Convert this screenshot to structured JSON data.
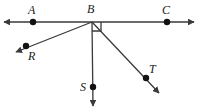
{
  "figure": {
    "stroke_color": "#3a3a3a",
    "label_color": "#1a1a1a",
    "background_color": "#ffffff",
    "width": 198,
    "height": 109,
    "line_width": 1.3,
    "dot_radius": 3.2
  },
  "points": [
    {
      "id": "A",
      "label": "A",
      "x": 33,
      "y": 22,
      "label_x": 28,
      "label_y": 4,
      "has_dot": true
    },
    {
      "id": "B",
      "label": "B",
      "x": 92,
      "y": 22,
      "label_x": 87,
      "label_y": 3,
      "has_dot": false
    },
    {
      "id": "C",
      "label": "C",
      "x": 167,
      "y": 22,
      "label_x": 162,
      "label_y": 4,
      "has_dot": true
    },
    {
      "id": "R",
      "label": "R",
      "x": 26,
      "y": 46,
      "label_x": 28,
      "label_y": 50,
      "has_dot": true
    },
    {
      "id": "S",
      "label": "S",
      "x": 93,
      "y": 87,
      "label_x": 80,
      "label_y": 81,
      "has_dot": true
    },
    {
      "id": "T",
      "label": "T",
      "x": 146,
      "y": 78,
      "label_x": 149,
      "label_y": 63,
      "has_dot": true
    }
  ],
  "line": {
    "name": "line-AC",
    "from_x": 4,
    "from_y": 22,
    "to_x": 194,
    "to_y": 22,
    "double_arrow": true
  },
  "rays": [
    {
      "name": "ray-BR",
      "from_x": 92,
      "from_y": 22,
      "to_x": 16,
      "to_y": 52
    },
    {
      "name": "ray-BS",
      "from_x": 92,
      "from_y": 22,
      "to_x": 93,
      "to_y": 106
    },
    {
      "name": "ray-BT",
      "from_x": 92,
      "from_y": 22,
      "to_x": 159,
      "to_y": 93
    }
  ],
  "right_angle": {
    "name": "right-angle-marker-SBC",
    "vertex_x": 92,
    "vertex_y": 22,
    "size": 9,
    "dir_x": 1,
    "dir_y": 1
  }
}
